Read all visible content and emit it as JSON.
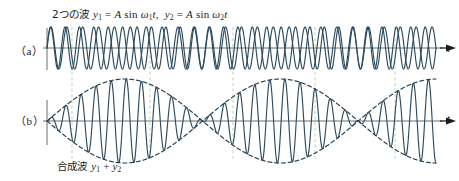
{
  "figure": {
    "width": 459,
    "height": 181,
    "background": "#ffffff",
    "title_caption": {
      "jp_prefix": "2つの波 ",
      "formula_1": "y1 = A sin ω1t",
      "separator": ", ",
      "formula_2": "y2 = A sin ω2t",
      "full_text": "2つの波 y1 = A sin ω1t, y2 = A sin ω2t"
    },
    "bottom_caption": {
      "jp_prefix": "合成波 ",
      "formula": "y1 + y2",
      "full_text": "合成波 y1 + y2"
    },
    "panels": [
      {
        "label": "（a）",
        "axis_label": "t",
        "description": "two overlapping sine waves"
      },
      {
        "label": "（b）",
        "axis_label": "t",
        "description": "superposed wave with beat envelope"
      }
    ]
  },
  "colors": {
    "wave": "#2c4a5e",
    "envelope": "#243d4e",
    "axis": "#6d6d6d",
    "guide": "#c7d6b4",
    "text": "#1d1d1d"
  },
  "chart_data": {
    "type": "line",
    "subtitle": "合成波 y1 + y2",
    "xlabel": "t",
    "ylabel": "",
    "grid": false,
    "legend": "none",
    "panels": [
      {
        "name": "(a)",
        "axis_label": "t",
        "baseline_y": 48,
        "x_start": 47,
        "x_end": 436,
        "amplitude": 21,
        "series": [
          {
            "name": "y1 = A sin ω1t",
            "amplitude": 1.0,
            "cycles": 27,
            "phase": 0,
            "color": "#2c4a5e"
          },
          {
            "name": "y2 = A sin ω2t",
            "amplitude": 1.0,
            "cycles": 24.5,
            "phase": 0,
            "color": "#2c4a5e"
          }
        ]
      },
      {
        "name": "(b)",
        "axis_label": "t",
        "baseline_y": 121,
        "x_start": 47,
        "x_end": 436,
        "amplitude": 42,
        "series": [
          {
            "name": "y1 + y2",
            "cycles": 25.75,
            "beat_cycles": 2.5,
            "color": "#2c4a5e"
          }
        ],
        "envelope": {
          "style": "dashed",
          "color": "#243d4e",
          "nodes_x": [
            72,
            233,
            395
          ],
          "antinodes_x": [
            150,
            315
          ]
        }
      }
    ],
    "guide_lines_x": [
      72,
      150,
      233,
      315,
      395
    ],
    "guide_line_style": "dashed",
    "guide_line_color": "#c7d6b4"
  }
}
